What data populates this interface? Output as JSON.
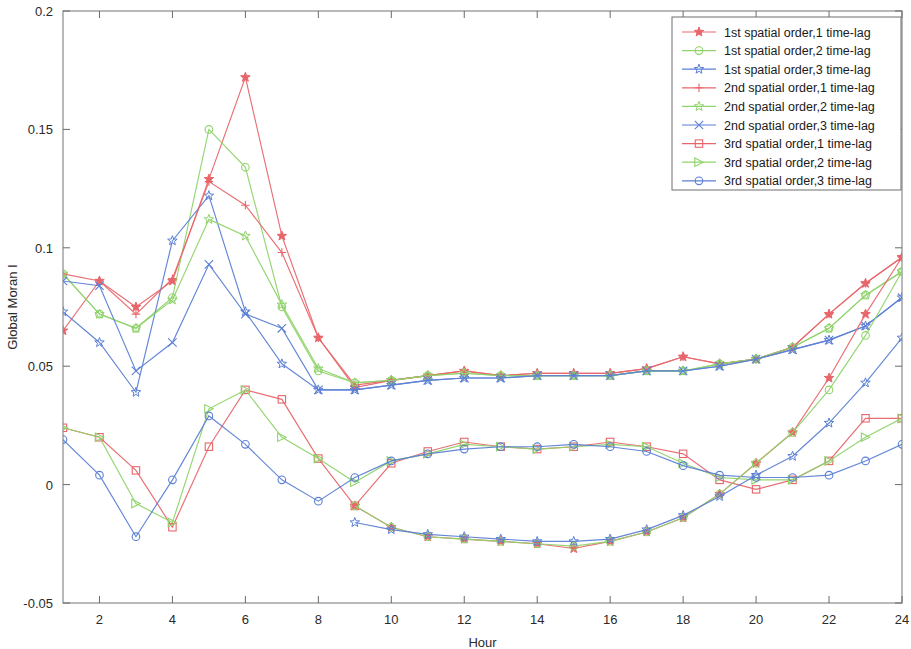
{
  "chart_data": {
    "type": "line",
    "title": "",
    "xlabel": "Hour",
    "ylabel": "Global Moran I",
    "xlim": [
      1,
      24
    ],
    "ylim": [
      -0.05,
      0.2
    ],
    "grid": false,
    "legend_position": "top-right",
    "x": [
      1,
      2,
      3,
      4,
      5,
      6,
      7,
      8,
      9,
      10,
      11,
      12,
      13,
      14,
      15,
      16,
      17,
      18,
      19,
      20,
      21,
      22,
      23,
      24
    ],
    "xticks": [
      2,
      4,
      6,
      8,
      10,
      12,
      14,
      16,
      18,
      20,
      22,
      24
    ],
    "xtick_labels": [
      "2",
      "4",
      "6",
      "8",
      "10",
      "12",
      "14",
      "16",
      "18",
      "20",
      "22",
      "24"
    ],
    "yticks": [
      -0.05,
      0,
      0.05,
      0.1,
      0.15,
      0.2
    ],
    "ytick_labels": [
      "-0.05",
      "0",
      "0.05",
      "0.1",
      "0.15",
      "0.2"
    ],
    "colors": {
      "red": "#e8666b",
      "green": "#8fd36a",
      "blue": "#5b7fd4"
    },
    "series": [
      {
        "name": "1st spatial order,1 time-lag",
        "color": "#e8666b",
        "marker": "star5-filled",
        "values": [
          0.065,
          0.086,
          0.075,
          0.086,
          0.129,
          0.172,
          0.105,
          0.062,
          0.041,
          0.044,
          0.046,
          0.048,
          0.046,
          0.047,
          0.047,
          0.047,
          0.049,
          0.054,
          0.051,
          0.053,
          0.058,
          0.072,
          0.085,
          0.096
        ]
      },
      {
        "name": "1st spatial order,2 time-lag",
        "color": "#8fd36a",
        "marker": "circle",
        "values": [
          0.089,
          0.072,
          0.066,
          0.079,
          0.15,
          0.134,
          0.075,
          0.048,
          0.043,
          0.044,
          0.046,
          0.047,
          0.046,
          0.046,
          0.046,
          0.046,
          0.048,
          0.048,
          0.051,
          0.053,
          0.058,
          0.066,
          0.08,
          0.09
        ]
      },
      {
        "name": "1st spatial order,3 time-lag",
        "color": "#5b7fd4",
        "marker": "star5-open",
        "values": [
          0.073,
          0.06,
          0.039,
          0.103,
          0.122,
          0.073,
          0.051,
          0.04,
          0.04,
          0.042,
          0.044,
          0.045,
          0.045,
          0.046,
          0.046,
          0.046,
          0.048,
          0.048,
          0.05,
          0.053,
          0.057,
          0.061,
          0.067,
          0.079
        ]
      },
      {
        "name": "2nd spatial order,1 time-lag",
        "color": "#e8666b",
        "marker": "plus",
        "values": [
          0.089,
          0.086,
          0.072,
          0.087,
          0.128,
          0.118,
          0.098,
          0.062,
          0.042,
          0.044,
          0.046,
          0.048,
          0.046,
          0.047,
          0.047,
          0.047,
          0.049,
          0.054,
          0.051,
          0.053,
          0.058,
          0.072,
          0.085,
          0.096
        ]
      },
      {
        "name": "2nd spatial order,2 time-lag",
        "color": "#8fd36a",
        "marker": "star5-open",
        "values": [
          0.089,
          0.072,
          0.066,
          0.078,
          0.112,
          0.105,
          0.076,
          0.049,
          0.043,
          0.044,
          0.046,
          0.047,
          0.046,
          0.046,
          0.046,
          0.046,
          0.048,
          0.048,
          0.051,
          0.053,
          0.058,
          0.066,
          0.08,
          0.09
        ]
      },
      {
        "name": "2nd spatial order,3 time-lag",
        "color": "#5b7fd4",
        "marker": "x-cross",
        "values": [
          0.086,
          0.084,
          0.048,
          0.06,
          0.093,
          0.072,
          0.066,
          0.04,
          0.04,
          0.042,
          0.044,
          0.045,
          0.045,
          0.046,
          0.046,
          0.046,
          0.048,
          0.048,
          0.05,
          0.053,
          0.057,
          0.061,
          0.067,
          0.079
        ]
      },
      {
        "name": "3rd spatial order,1 time-lag",
        "color": "#e8666b",
        "marker": "square",
        "values": [
          0.024,
          0.02,
          0.006,
          -0.018,
          0.016,
          0.04,
          0.036,
          0.011,
          -0.009,
          0.009,
          0.014,
          0.018,
          0.016,
          0.015,
          0.016,
          0.018,
          0.016,
          0.013,
          0.002,
          -0.002,
          0.002,
          0.01,
          0.028,
          0.028
        ]
      },
      {
        "name": "3rd spatial order,2 time-lag",
        "color": "#8fd36a",
        "marker": "triangle-right",
        "values": [
          0.024,
          0.02,
          -0.008,
          -0.016,
          0.032,
          0.04,
          0.02,
          0.011,
          0.001,
          0.01,
          0.013,
          0.017,
          0.016,
          0.015,
          0.016,
          0.017,
          0.016,
          0.009,
          0.003,
          0.002,
          0.002,
          0.01,
          0.02,
          0.028
        ]
      },
      {
        "name": "3rd spatial order,3 time-lag",
        "color": "#5b7fd4",
        "marker": "circle",
        "values": [
          0.019,
          0.004,
          -0.022,
          0.002,
          0.029,
          0.017,
          0.002,
          -0.007,
          0.003,
          0.01,
          0.013,
          0.015,
          0.016,
          0.016,
          0.017,
          0.016,
          0.014,
          0.008,
          0.004,
          0.003,
          0.003,
          0.004,
          0.01,
          0.017
        ]
      },
      {
        "name": "lower-band-series-a",
        "color": "#e8666b",
        "marker": "star5-filled",
        "hidden_from_legend": true,
        "values": [
          null,
          null,
          null,
          null,
          null,
          null,
          null,
          null,
          -0.009,
          -0.018,
          -0.022,
          -0.023,
          -0.024,
          -0.025,
          -0.027,
          -0.024,
          -0.02,
          -0.014,
          -0.004,
          0.009,
          0.022,
          0.045,
          0.072,
          0.096
        ]
      },
      {
        "name": "lower-band-series-b",
        "color": "#8fd36a",
        "marker": "circle",
        "hidden_from_legend": true,
        "values": [
          null,
          null,
          null,
          null,
          null,
          null,
          null,
          null,
          -0.009,
          -0.018,
          -0.022,
          -0.023,
          -0.024,
          -0.025,
          -0.026,
          -0.024,
          -0.02,
          -0.014,
          -0.004,
          0.009,
          0.022,
          0.04,
          0.063,
          0.09
        ]
      },
      {
        "name": "lower-band-series-c",
        "color": "#5b7fd4",
        "marker": "star5-open",
        "hidden_from_legend": true,
        "values": [
          null,
          null,
          null,
          null,
          null,
          null,
          null,
          null,
          -0.016,
          -0.019,
          -0.021,
          -0.022,
          -0.023,
          -0.024,
          -0.024,
          -0.023,
          -0.019,
          -0.013,
          -0.005,
          0.004,
          0.012,
          0.026,
          0.043,
          0.062
        ]
      }
    ]
  },
  "legend": {
    "items": [
      {
        "label": "1st spatial order,1 time-lag",
        "color": "#e8666b",
        "marker": "star5-filled"
      },
      {
        "label": "1st spatial order,2 time-lag",
        "color": "#8fd36a",
        "marker": "circle"
      },
      {
        "label": "1st spatial order,3 time-lag",
        "color": "#5b7fd4",
        "marker": "star5-open"
      },
      {
        "label": "2nd spatial order,1 time-lag",
        "color": "#e8666b",
        "marker": "plus"
      },
      {
        "label": "2nd spatial order,2 time-lag",
        "color": "#8fd36a",
        "marker": "star5-open"
      },
      {
        "label": "2nd spatial order,3 time-lag",
        "color": "#5b7fd4",
        "marker": "x-cross"
      },
      {
        "label": "3rd spatial order,1 time-lag",
        "color": "#e8666b",
        "marker": "square"
      },
      {
        "label": "3rd spatial order,2 time-lag",
        "color": "#8fd36a",
        "marker": "triangle-right"
      },
      {
        "label": "3rd spatial order,3 time-lag",
        "color": "#5b7fd4",
        "marker": "circle"
      }
    ]
  }
}
